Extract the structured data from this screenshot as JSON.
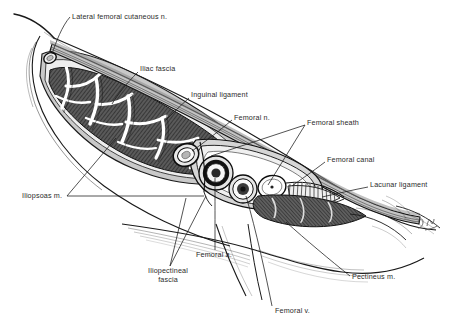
{
  "figure": {
    "kind": "anatomical-illustration",
    "artist_signature": "D.M",
    "background_color": "#ffffff",
    "ink_color": "#1a1a1a",
    "muscle_fill": "#555555",
    "fascia_fill": "#b8b8b8",
    "vessel_lumen": "#f2f2f2"
  },
  "labels": [
    {
      "id": "lateral-femoral-cutaneous-n",
      "text": "Lateral femoral cutaneous n.",
      "x": 72,
      "y": 12
    },
    {
      "id": "iliac-fascia",
      "text": "Iliac fascia",
      "x": 140,
      "y": 68
    },
    {
      "id": "inguinal-ligament",
      "text": "Inguinal ligament",
      "x": 191,
      "y": 94
    },
    {
      "id": "femoral-n",
      "text": "Femoral n.",
      "x": 234,
      "y": 116
    },
    {
      "id": "femoral-sheath",
      "text": "Femoral sheath",
      "x": 307,
      "y": 121
    },
    {
      "id": "femoral-canal",
      "text": "Femoral canal",
      "x": 327,
      "y": 158
    },
    {
      "id": "lacunar-ligament",
      "text": "Lacunar ligament",
      "x": 370,
      "y": 183
    },
    {
      "id": "iliopsoas-m",
      "text": "Iliopsoas m.",
      "x": 27,
      "y": 193
    },
    {
      "id": "femoral-a",
      "text": "Femoral a.",
      "x": 196,
      "y": 252
    },
    {
      "id": "iliopectineal-fascia",
      "text": "Iliopectineal fascia",
      "x": 141,
      "y": 270,
      "wrap": true
    },
    {
      "id": "pectineus-m",
      "text": "Pectineus m.",
      "x": 352,
      "y": 274
    },
    {
      "id": "femoral-v",
      "text": "Femoral v.",
      "x": 275,
      "y": 309
    }
  ],
  "structures": [
    {
      "id": "femoral-nerve-section",
      "name": "Femoral nerve"
    },
    {
      "id": "femoral-artery-section",
      "name": "Femoral artery"
    },
    {
      "id": "femoral-vein-section",
      "name": "Femoral vein"
    },
    {
      "id": "femoral-canal-section",
      "name": "Femoral canal"
    },
    {
      "id": "lateral-cutaneous-nerve-section",
      "name": "Lateral femoral cutaneous nerve"
    },
    {
      "id": "iliopsoas-muscle-mass",
      "name": "Iliopsoas muscle"
    },
    {
      "id": "pectineus-muscle-mass",
      "name": "Pectineus muscle"
    },
    {
      "id": "inguinal-ligament-band",
      "name": "Inguinal ligament"
    },
    {
      "id": "iliac-fascia-layer",
      "name": "Iliac fascia"
    },
    {
      "id": "lacunar-ligament-fan",
      "name": "Lacunar ligament"
    },
    {
      "id": "iliopectineal-fascia-septum",
      "name": "Iliopectineal fascia"
    }
  ]
}
